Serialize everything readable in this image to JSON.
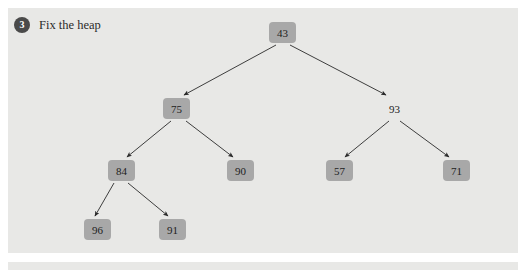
{
  "panel": {
    "background_color": "#e8e8e6"
  },
  "step": {
    "number": "3",
    "title": "Fix the heap",
    "badge_color": "#4a4a4a"
  },
  "diagram": {
    "node_box_color": "#a8a8a8",
    "edge_color": "#2a2a2a",
    "nodes": [
      {
        "id": "n43",
        "label": "43",
        "boxed": true,
        "x": 269,
        "y": 22,
        "w": 27,
        "h": 21
      },
      {
        "id": "n75",
        "label": "75",
        "boxed": true,
        "x": 163,
        "y": 98,
        "w": 27,
        "h": 21
      },
      {
        "id": "n93",
        "label": "93",
        "boxed": false,
        "x": 381,
        "y": 98,
        "w": 27,
        "h": 21
      },
      {
        "id": "n84",
        "label": "84",
        "boxed": true,
        "x": 108,
        "y": 160,
        "w": 27,
        "h": 21
      },
      {
        "id": "n90",
        "label": "90",
        "boxed": true,
        "x": 227,
        "y": 160,
        "w": 27,
        "h": 21
      },
      {
        "id": "n57",
        "label": "57",
        "boxed": true,
        "x": 326,
        "y": 160,
        "w": 27,
        "h": 21
      },
      {
        "id": "n71",
        "label": "71",
        "boxed": true,
        "x": 443,
        "y": 160,
        "w": 27,
        "h": 21
      },
      {
        "id": "n96",
        "label": "96",
        "boxed": true,
        "x": 84,
        "y": 219,
        "w": 27,
        "h": 21
      },
      {
        "id": "n91",
        "label": "91",
        "boxed": true,
        "x": 159,
        "y": 219,
        "w": 27,
        "h": 21
      }
    ],
    "edges": [
      {
        "from": "n43",
        "to": "n75",
        "x1": 276,
        "y1": 45,
        "x2": 184,
        "y2": 95
      },
      {
        "from": "n43",
        "to": "n93",
        "x1": 290,
        "y1": 45,
        "x2": 386,
        "y2": 95
      },
      {
        "from": "n75",
        "to": "n84",
        "x1": 171,
        "y1": 121,
        "x2": 127,
        "y2": 157
      },
      {
        "from": "n75",
        "to": "n90",
        "x1": 186,
        "y1": 121,
        "x2": 233,
        "y2": 157
      },
      {
        "from": "n93",
        "to": "n57",
        "x1": 389,
        "y1": 121,
        "x2": 345,
        "y2": 157
      },
      {
        "from": "n93",
        "to": "n71",
        "x1": 400,
        "y1": 121,
        "x2": 449,
        "y2": 157
      },
      {
        "from": "n84",
        "to": "n96",
        "x1": 114,
        "y1": 183,
        "x2": 95,
        "y2": 216
      },
      {
        "from": "n84",
        "to": "n91",
        "x1": 128,
        "y1": 183,
        "x2": 168,
        "y2": 216
      }
    ]
  }
}
